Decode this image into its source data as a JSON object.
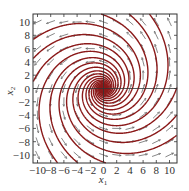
{
  "chart_data": {
    "type": "vector_field",
    "title": "",
    "xlabel": "x1",
    "ylabel": "x2",
    "xlim": [
      -11,
      11
    ],
    "ylim": [
      -11,
      11
    ],
    "x_ticks": [
      -10,
      -8,
      -6,
      -4,
      -2,
      0,
      2,
      4,
      6,
      8,
      10
    ],
    "y_ticks": [
      10,
      8,
      6,
      4,
      2,
      0,
      -2,
      -4,
      -6,
      -8,
      -10
    ],
    "x_tick_labels": [
      "−10",
      "−8",
      "−6",
      "−4",
      "−2",
      "0",
      "2",
      "4",
      "6",
      "8",
      "10"
    ],
    "y_tick_labels": [
      "10",
      "8",
      "6",
      "4",
      "2",
      "0",
      "−2",
      "−4",
      "−6",
      "−8",
      "−10"
    ],
    "grid": false,
    "axes_through_origin": true,
    "system": {
      "a": 0.35,
      "b": 1.0,
      "form": "x1' = a*x1 - b*x2, x2' = b*x1 + a*x2"
    },
    "field_grid_spacing": 2,
    "trajectory_count": 12,
    "colors": {
      "trajectory": "#8b1a1a",
      "arrow": "#555555",
      "axis": "#333333"
    }
  },
  "labels": {
    "xlabel": "x",
    "xlabel_sub": "1",
    "ylabel": "x",
    "ylabel_sub": "2"
  }
}
